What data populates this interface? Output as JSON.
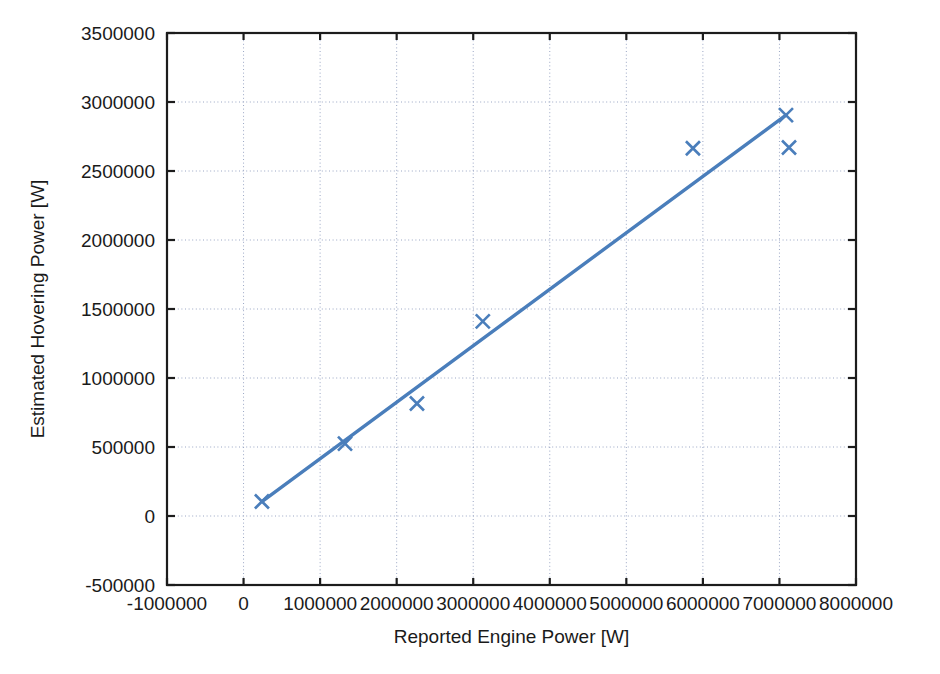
{
  "chart_data": {
    "type": "scatter",
    "title": "",
    "xlabel": "Reported Engine Power [W]",
    "ylabel": "Estimated Hovering Power [W]",
    "xlim": [
      -1000000,
      8000000
    ],
    "ylim": [
      -500000,
      3500000
    ],
    "grid": true,
    "legend": "none",
    "marker": "x",
    "series_color": "#4a7ebb",
    "x_ticks": [
      {
        "value": -1000000,
        "label": "-1000000"
      },
      {
        "value": 0,
        "label": "0"
      },
      {
        "value": 1000000,
        "label": "1000000"
      },
      {
        "value": 2000000,
        "label": "2000000"
      },
      {
        "value": 3000000,
        "label": "3000000"
      },
      {
        "value": 4000000,
        "label": "4000000"
      },
      {
        "value": 5000000,
        "label": "5000000"
      },
      {
        "value": 6000000,
        "label": "6000000"
      },
      {
        "value": 7000000,
        "label": "7000000"
      },
      {
        "value": 8000000,
        "label": "8000000"
      }
    ],
    "y_ticks": [
      {
        "value": -500000,
        "label": "-500000"
      },
      {
        "value": 0,
        "label": "0"
      },
      {
        "value": 500000,
        "label": "500000"
      },
      {
        "value": 1000000,
        "label": "1000000"
      },
      {
        "value": 1500000,
        "label": "1500000"
      },
      {
        "value": 2000000,
        "label": "2000000"
      },
      {
        "value": 2500000,
        "label": "2500000"
      },
      {
        "value": 3000000,
        "label": "3000000"
      },
      {
        "value": 3500000,
        "label": "3500000"
      }
    ],
    "series": [
      {
        "name": "Estimated Hovering Power",
        "type": "scatter",
        "marker": "x",
        "color": "#4a7ebb",
        "points": [
          {
            "x": 240000,
            "y": 105000
          },
          {
            "x": 1325000,
            "y": 525000
          },
          {
            "x": 2265000,
            "y": 815000
          },
          {
            "x": 3125000,
            "y": 1410000
          },
          {
            "x": 5870000,
            "y": 2665000
          },
          {
            "x": 7085000,
            "y": 2905000
          },
          {
            "x": 7125000,
            "y": 2670000
          }
        ]
      },
      {
        "name": "Trend line",
        "type": "line",
        "color": "#4a7ebb",
        "points": [
          {
            "x": 240000,
            "y": 105000
          },
          {
            "x": 7085000,
            "y": 2905000
          }
        ]
      }
    ]
  },
  "plot_geometry": {
    "left": 167,
    "right": 856,
    "top": 33,
    "bottom": 585
  }
}
